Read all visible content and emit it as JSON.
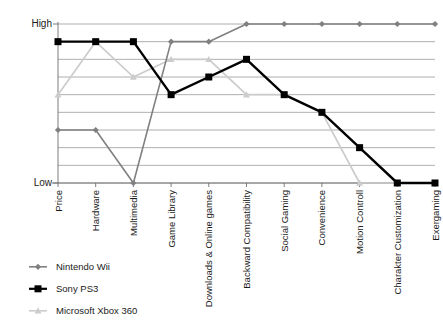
{
  "chart_data": {
    "type": "line",
    "title": "",
    "xlabel": "",
    "ylabel": "",
    "grid": true,
    "legend_position": "bottom-left",
    "y_axis": {
      "tick_labels": [
        "High",
        "Low"
      ],
      "high_label": "High",
      "low_label": "Low",
      "gridline_count": 10,
      "ylim": [
        0,
        9
      ],
      "scale_note": "Ordinal scale from Low (0) to High (9)"
    },
    "categories": [
      "Price",
      "Hardware",
      "Multimedia",
      "Game Library",
      "Downloads & Online games",
      "Backward Compatibility",
      "Social Gaming",
      "Convenience",
      "Motion Controll",
      "Charakter Customization",
      "Exergaming"
    ],
    "series": [
      {
        "name": "Nintendo Wii",
        "color": "#808080",
        "marker": "diamond",
        "values": [
          3,
          3,
          0,
          8,
          8,
          9,
          9,
          9,
          9,
          9,
          9
        ]
      },
      {
        "name": "Sony PS3",
        "color": "#000000",
        "marker": "square",
        "values": [
          8,
          8,
          8,
          5,
          6,
          7,
          5,
          4,
          2,
          0,
          0
        ]
      },
      {
        "name": "Microsoft Xbox 360",
        "color": "#cccccc",
        "marker": "triangle",
        "values": [
          5,
          8,
          6,
          7,
          7,
          5,
          5,
          4,
          0,
          0,
          0
        ]
      }
    ]
  },
  "legend": {
    "items": [
      {
        "label": "Nintendo Wii",
        "marker": "diamond-marker",
        "color": "#808080"
      },
      {
        "label": "Sony PS3",
        "marker": "square-marker",
        "color": "#000000"
      },
      {
        "label": "Microsoft Xbox 360",
        "marker": "triangle-marker",
        "color": "#cccccc"
      }
    ]
  }
}
